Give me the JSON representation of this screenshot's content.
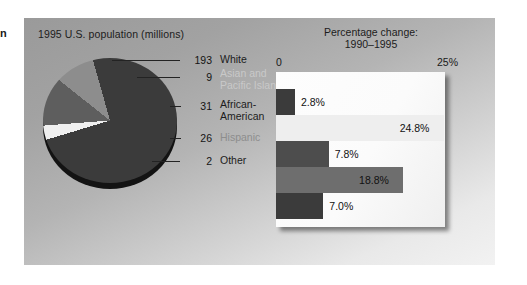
{
  "margin_text": "n",
  "figure": {
    "pie": {
      "title": "1995 U.S. population (millions)",
      "slices": [
        {
          "label": "White",
          "value": "193",
          "number": 193,
          "color": "#3b3b3b",
          "label_tone": "dark"
        },
        {
          "label": "Asian and\nPacific Islander",
          "value": "9",
          "number": 9,
          "color": "#efefef",
          "label_tone": "light"
        },
        {
          "label": "African-\nAmerican",
          "value": "31",
          "number": 31,
          "color": "#5e5e5e",
          "label_tone": "dark"
        },
        {
          "label": "Hispanic",
          "value": "26",
          "number": 26,
          "color": "#8d8d8d",
          "label_tone": "mid"
        },
        {
          "label": "Other",
          "value": "2",
          "number": 2,
          "color": "#3b3b3b",
          "label_tone": "dark"
        }
      ]
    },
    "bars": {
      "title_line1": "Percentage change:",
      "title_line2": "1990–1995",
      "axis_min_label": "0",
      "axis_max_label": "25%",
      "items": [
        {
          "label": "White",
          "value": "2.8%",
          "number": 2.8,
          "color": "#3b3b3b"
        },
        {
          "label": "Asian and Pacific Islander",
          "value": "24.8%",
          "number": 24.8,
          "color": "#eeeeee"
        },
        {
          "label": "African-American",
          "value": "7.8%",
          "number": 7.8,
          "color": "#4d4d4d"
        },
        {
          "label": "Hispanic",
          "value": "18.8%",
          "number": 18.8,
          "color": "#6e6e6e"
        },
        {
          "label": "Other",
          "value": "7.0%",
          "number": 7.0,
          "color": "#3b3b3b"
        }
      ]
    }
  },
  "chart_data": [
    {
      "type": "pie",
      "title": "1995 U.S. population (millions)",
      "categories": [
        "White",
        "Asian and Pacific Islander",
        "African-American",
        "Hispanic",
        "Other"
      ],
      "values": [
        193,
        9,
        31,
        26,
        2
      ],
      "unit": "millions",
      "total": 261,
      "colors": [
        "#3b3b3b",
        "#efefef",
        "#5e5e5e",
        "#8d8d8d",
        "#3b3b3b"
      ],
      "legend": "right-of-pie-with-leader-lines",
      "data_labels": [
        "193",
        "9",
        "31",
        "26",
        "2"
      ],
      "three_d": true
    },
    {
      "type": "bar",
      "orientation": "horizontal",
      "title": "Percentage change: 1990–1995",
      "xlabel": "",
      "ylabel": "",
      "categories": [
        "White",
        "Asian and Pacific Islander",
        "African-American",
        "Hispanic",
        "Other"
      ],
      "values": [
        2.8,
        24.8,
        7.8,
        18.8,
        7.0
      ],
      "data_labels": [
        "2.8%",
        "24.8%",
        "7.8%",
        "18.8%",
        "7.0%"
      ],
      "xlim": [
        0,
        25
      ],
      "tick_labels": [
        "0",
        "25%"
      ],
      "grid": false,
      "legend": "none",
      "colors": [
        "#3b3b3b",
        "#eeeeee",
        "#4d4d4d",
        "#6e6e6e",
        "#3b3b3b"
      ]
    }
  ]
}
